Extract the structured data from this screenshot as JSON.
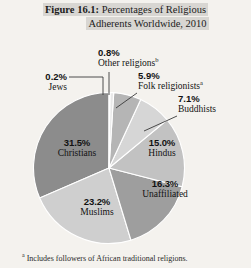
{
  "figure": {
    "label": "Figure 16.1:",
    "title_line_1": "Percentages of Religious",
    "title_line_2": "Adherents Worldwide, 2010",
    "footnote_marker": "a",
    "footnote_text": "Includes followers of African traditional religions."
  },
  "colors": {
    "background": "#f4f2ee",
    "title_highlight": "#d8d6d2",
    "christians": "#8c8c8c",
    "muslims": "#cfcfcf",
    "unaffiliated": "#9e9e9e",
    "hindus": "#c2c2c2",
    "buddhists": "#d6d6d6",
    "folk_religionists": "#b5b5b5",
    "other_religions": "#e8e8e8",
    "jews": "#efefef",
    "slice_outline": "#ffffff",
    "leader_line": "#3a3a3a",
    "text": "#121212"
  },
  "chart_data": {
    "type": "pie",
    "title": "Figure 16.1: Percentages of Religious Adherents Worldwide, 2010",
    "ylabel": "",
    "xlabel": "",
    "legend_position": "none",
    "grid": false,
    "total": 100.0,
    "categories": [
      "Christians",
      "Muslims",
      "Unaffiliated",
      "Hindus",
      "Buddhists",
      "Folk religionists",
      "Other religions",
      "Jews"
    ],
    "values": [
      31.5,
      23.2,
      16.3,
      15.0,
      7.1,
      5.9,
      0.8,
      0.2
    ],
    "slices": [
      {
        "name": "Christians",
        "value": 31.5,
        "value_label": "31.5%",
        "label_style": "inside",
        "footnote": ""
      },
      {
        "name": "Muslims",
        "value": 23.2,
        "value_label": "23.2%",
        "label_style": "inside",
        "footnote": ""
      },
      {
        "name": "Unaffiliated",
        "value": 16.3,
        "value_label": "16.3%",
        "label_style": "inside",
        "footnote": ""
      },
      {
        "name": "Hindus",
        "value": 15.0,
        "value_label": "15.0%",
        "label_style": "inside",
        "footnote": ""
      },
      {
        "name": "Buddhists",
        "value": 7.1,
        "value_label": "7.1%",
        "label_style": "callout",
        "footnote": ""
      },
      {
        "name": "Folk religionists",
        "value": 5.9,
        "value_label": "5.9%",
        "label_style": "callout",
        "footnote": "a"
      },
      {
        "name": "Other religions",
        "value": 0.8,
        "value_label": "0.8%",
        "label_style": "callout",
        "footnote": "b"
      },
      {
        "name": "Jews",
        "value": 0.2,
        "value_label": "0.2%",
        "label_style": "callout",
        "footnote": ""
      }
    ]
  }
}
